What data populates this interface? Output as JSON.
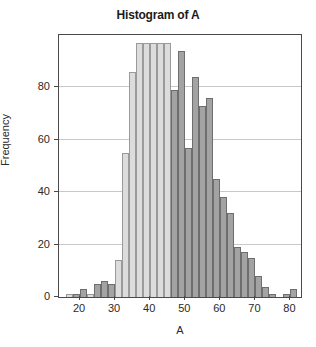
{
  "chart_data": {
    "type": "bar",
    "subtype": "overlaid-histogram",
    "title": "Histogram of A",
    "xlabel": "A",
    "ylabel": "Frequency",
    "xlim": [
      14,
      83
    ],
    "ylim": [
      0,
      100
    ],
    "xticks": [
      20,
      30,
      40,
      50,
      60,
      70,
      80
    ],
    "yticks": [
      0,
      20,
      40,
      60,
      80
    ],
    "grid": "horizontal",
    "legend": "none",
    "bin_width": 2,
    "clipped_top": true,
    "colors": {
      "series_light": "#dcdcdc",
      "series_light_edge": "#9a9a9a",
      "series_dark": "#a3a3a3",
      "series_dark_edge": "#6e6e6e",
      "frame": "#4a4a4a",
      "gridline": "#c8c8c8",
      "text": "#2a2a2a",
      "title": "#1b1b1b",
      "background": "#ffffff"
    },
    "series": [
      {
        "name": "light",
        "color": "#dcdcdc",
        "bins": [
          {
            "x0": 16,
            "x1": 18,
            "value": 1
          },
          {
            "x0": 18,
            "x1": 20,
            "value": 1
          },
          {
            "x0": 20,
            "x1": 22,
            "value": 3
          },
          {
            "x0": 22,
            "x1": 24,
            "value": 1
          },
          {
            "x0": 24,
            "x1": 26,
            "value": 1
          },
          {
            "x0": 26,
            "x1": 28,
            "value": 1
          },
          {
            "x0": 28,
            "x1": 30,
            "value": 2
          },
          {
            "x0": 30,
            "x1": 32,
            "value": 14
          },
          {
            "x0": 32,
            "x1": 34,
            "value": 55
          },
          {
            "x0": 34,
            "x1": 36,
            "value": 86
          },
          {
            "x0": 36,
            "x1": 38,
            "value": 97
          },
          {
            "x0": 38,
            "x1": 40,
            "value": 97
          },
          {
            "x0": 40,
            "x1": 42,
            "value": 97
          },
          {
            "x0": 42,
            "x1": 44,
            "value": 97
          },
          {
            "x0": 44,
            "x1": 46,
            "value": 97
          },
          {
            "x0": 46,
            "x1": 48,
            "value": 79
          },
          {
            "x0": 48,
            "x1": 50,
            "value": 52
          },
          {
            "x0": 50,
            "x1": 52,
            "value": 13
          },
          {
            "x0": 52,
            "x1": 54,
            "value": 5
          },
          {
            "x0": 54,
            "x1": 56,
            "value": 1
          }
        ]
      },
      {
        "name": "dark",
        "color": "#a3a3a3",
        "bins": [
          {
            "x0": 18,
            "x1": 20,
            "value": 1
          },
          {
            "x0": 20,
            "x1": 22,
            "value": 3
          },
          {
            "x0": 24,
            "x1": 26,
            "value": 5
          },
          {
            "x0": 26,
            "x1": 28,
            "value": 6
          },
          {
            "x0": 28,
            "x1": 30,
            "value": 5
          },
          {
            "x0": 46,
            "x1": 48,
            "value": 79
          },
          {
            "x0": 48,
            "x1": 50,
            "value": 94
          },
          {
            "x0": 50,
            "x1": 52,
            "value": 57
          },
          {
            "x0": 52,
            "x1": 54,
            "value": 84
          },
          {
            "x0": 54,
            "x1": 56,
            "value": 73
          },
          {
            "x0": 56,
            "x1": 58,
            "value": 76
          },
          {
            "x0": 58,
            "x1": 60,
            "value": 45
          },
          {
            "x0": 60,
            "x1": 62,
            "value": 38
          },
          {
            "x0": 62,
            "x1": 64,
            "value": 32
          },
          {
            "x0": 64,
            "x1": 66,
            "value": 19
          },
          {
            "x0": 66,
            "x1": 68,
            "value": 17
          },
          {
            "x0": 68,
            "x1": 70,
            "value": 15
          },
          {
            "x0": 70,
            "x1": 72,
            "value": 8
          },
          {
            "x0": 72,
            "x1": 74,
            "value": 4
          },
          {
            "x0": 74,
            "x1": 76,
            "value": 1
          },
          {
            "x0": 78,
            "x1": 80,
            "value": 1
          },
          {
            "x0": 80,
            "x1": 82,
            "value": 3
          }
        ]
      }
    ]
  }
}
